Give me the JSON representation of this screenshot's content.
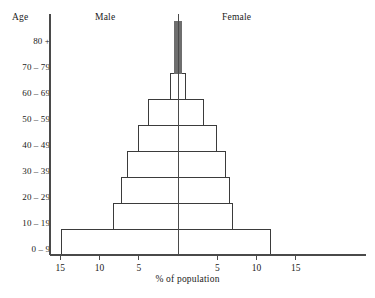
{
  "headers": {
    "age": "Age",
    "male": "Male",
    "female": "Female"
  },
  "axis": {
    "x_label": "% of population",
    "x_ticks_left": [
      "15",
      "10",
      "5"
    ],
    "x_ticks_right": [
      "5",
      "10",
      "15"
    ],
    "y_labels": [
      "80 +",
      "70 – 79",
      "60 – 69",
      "50 – 59",
      "40 – 49",
      "30 – 39",
      "20 – 29",
      "10 – 19",
      "0 – 9"
    ]
  },
  "colors": {
    "line": "#3b3b3b",
    "axis": "#4a4a4a",
    "fill_top": "#6e6e6e",
    "background": "#ffffff",
    "text": "#1a1a1a"
  },
  "chart_data": {
    "type": "bar",
    "title": "",
    "subtitle": "",
    "xlabel": "% of population",
    "ylabel": "Age",
    "orientation": "horizontal",
    "layout": "population-pyramid",
    "legend_position": "top",
    "grid": false,
    "xlim": [
      -17,
      17
    ],
    "x_tick_values": [
      -15,
      -10,
      -5,
      5,
      10,
      15
    ],
    "x_tick_labels": [
      "15",
      "10",
      "5",
      "5",
      "10",
      "15"
    ],
    "categories": [
      "0 – 9",
      "10 – 19",
      "20 – 29",
      "30 – 39",
      "40 – 49",
      "50 – 59",
      "60 – 69",
      "70 – 79",
      "80 +"
    ],
    "series": [
      {
        "name": "Male",
        "side": "left",
        "values": [
          14.8,
          8.2,
          7.2,
          6.4,
          5.0,
          3.8,
          0.9,
          0.5,
          0.4
        ]
      },
      {
        "name": "Female",
        "side": "right",
        "values": [
          11.8,
          7.0,
          6.6,
          6.1,
          4.9,
          3.3,
          0.9,
          0.5,
          0.4
        ]
      }
    ]
  }
}
